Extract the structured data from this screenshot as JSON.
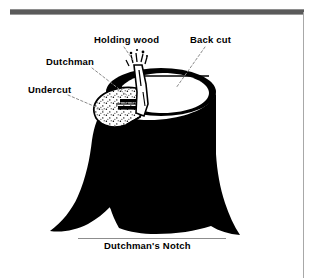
{
  "page": {
    "background_color": "#ffffff",
    "ink_color": "#000000",
    "rule_color": "#5a5a5a"
  },
  "chrome": {
    "top_bar_name": "top-divider-bar",
    "right_rule_name": "right-margin-rule"
  },
  "figure": {
    "name": "tree-stump-felling-cuts-illustration"
  },
  "labels": {
    "holding_wood": "Holding wood",
    "back_cut": "Back cut",
    "dutchman": "Dutchman",
    "undercut": "Undercut",
    "caption": "Dutchman's Notch"
  }
}
